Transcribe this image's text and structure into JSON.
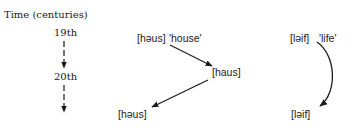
{
  "timeline": {
    "title": "Time (centuries)",
    "ticks": [
      "19th",
      "20th"
    ]
  },
  "house": {
    "source": "[həus]",
    "gloss": "'house'",
    "middle": "[haus]",
    "result": "[həus]"
  },
  "life": {
    "source": "[ləif]",
    "gloss": "'life'",
    "result": "[ləif]"
  },
  "colors": {
    "ink": "#1a1a1a",
    "background": "#ffffff"
  }
}
